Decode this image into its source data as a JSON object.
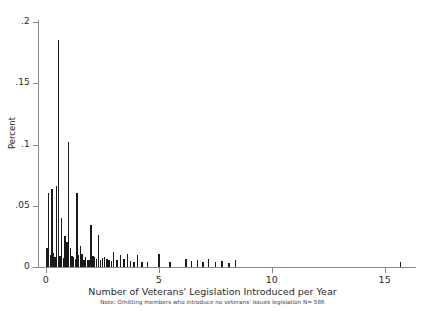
{
  "chart_data": {
    "type": "bar",
    "title": "",
    "subtitle": "",
    "xlabel": "Number of Veterans' Legislation Introduced per Year",
    "ylabel": "Percent",
    "note": "Note: Omitting members who introduce no veterans' issues legislation N= 586",
    "grid": false,
    "legend": false,
    "legend_position": "none",
    "bar_color": "#1a1a1a",
    "axis_color": "#8a8a8a",
    "xlim": [
      -0.35,
      16.3
    ],
    "ylim": [
      0,
      0.2
    ],
    "xticks": [
      0,
      5,
      10,
      15
    ],
    "xtick_labels": [
      "0",
      "5",
      "10",
      "15"
    ],
    "yticks": [
      0,
      0.05,
      0.1,
      0.15,
      0.2
    ],
    "ytick_labels": [
      "0",
      ".05",
      ".1",
      ".15",
      ".2"
    ],
    "bar_width": 0.055,
    "x": [
      0.05,
      0.12,
      0.2,
      0.27,
      0.33,
      0.4,
      0.47,
      0.55,
      0.62,
      0.7,
      0.78,
      0.85,
      0.93,
      1.0,
      1.08,
      1.15,
      1.22,
      1.3,
      1.38,
      1.45,
      1.52,
      1.6,
      1.68,
      1.75,
      1.83,
      1.9,
      2.0,
      2.08,
      2.15,
      2.25,
      2.33,
      2.42,
      2.5,
      2.6,
      2.7,
      2.8,
      2.9,
      3.0,
      3.15,
      3.3,
      3.45,
      3.6,
      3.75,
      3.9,
      4.05,
      4.25,
      4.5,
      5.0,
      5.5,
      6.2,
      6.45,
      6.7,
      6.95,
      7.2,
      7.5,
      7.8,
      8.1,
      8.4,
      15.7
    ],
    "values": [
      0.0155,
      0.0605,
      0.0098,
      0.064,
      0.0112,
      0.0085,
      0.066,
      0.185,
      0.009,
      0.0402,
      0.0075,
      0.025,
      0.0205,
      0.102,
      0.0155,
      0.009,
      0.0078,
      0.0068,
      0.0605,
      0.0098,
      0.0175,
      0.011,
      0.006,
      0.0082,
      0.006,
      0.0055,
      0.034,
      0.0092,
      0.0078,
      0.0068,
      0.026,
      0.006,
      0.0072,
      0.0082,
      0.0062,
      0.0055,
      0.0048,
      0.0125,
      0.0058,
      0.0098,
      0.0062,
      0.011,
      0.005,
      0.0045,
      0.0098,
      0.0042,
      0.0038,
      0.0105,
      0.0042,
      0.0065,
      0.0048,
      0.0058,
      0.0042,
      0.0062,
      0.0038,
      0.0048,
      0.0035,
      0.0055,
      0.004
    ]
  }
}
